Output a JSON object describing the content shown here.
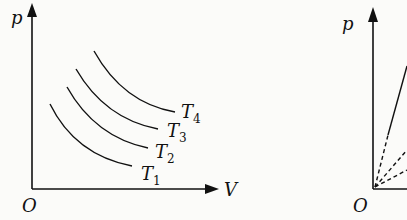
{
  "left_diagram": {
    "title": "p-V isotherms",
    "y_axis_label": "p",
    "x_axis_label": "V",
    "origin_label": "O",
    "curves": [
      {
        "name": "T",
        "sub": "1"
      },
      {
        "name": "T",
        "sub": "2"
      },
      {
        "name": "T",
        "sub": "3"
      },
      {
        "name": "T",
        "sub": "4"
      }
    ]
  },
  "right_diagram": {
    "y_axis_label": "p",
    "origin_label": "O"
  },
  "colors": {
    "ink": "#111111",
    "background": "#fbfbf9"
  }
}
